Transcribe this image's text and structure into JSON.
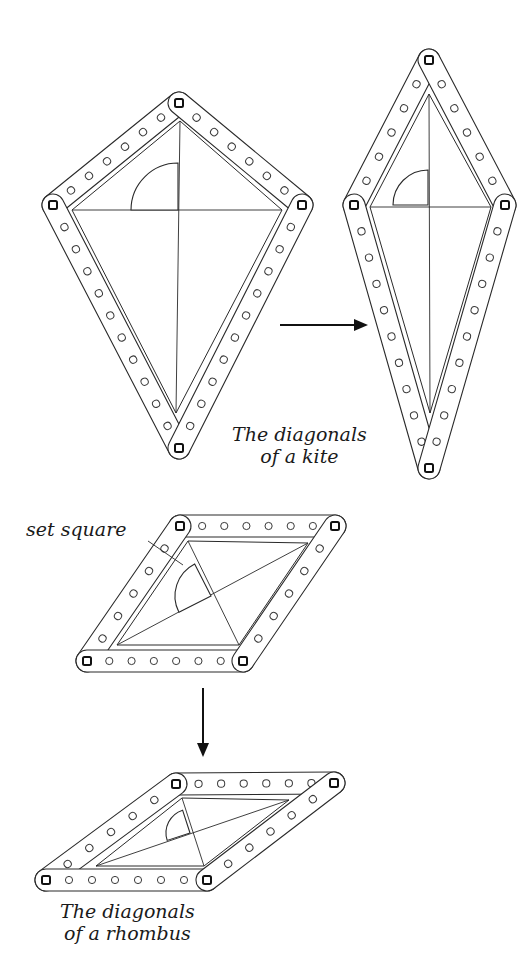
{
  "figure": {
    "captions": {
      "kite": [
        "The diagonals",
        "of a kite"
      ],
      "rhombus": [
        "The diagonals",
        "of a rhombus"
      ],
      "set_square_label": "set square"
    },
    "colors": {
      "ink": "#2a2a2a",
      "paper": "#ffffff"
    },
    "bar_width": 22,
    "diagrams": [
      {
        "id": "kite-1",
        "bars": [
          {
            "a": [
              179,
              103
            ],
            "b": [
              53,
              205
            ],
            "holes": 6
          },
          {
            "a": [
              179,
              103
            ],
            "b": [
              302,
              205
            ],
            "holes": 6
          },
          {
            "a": [
              53,
              205
            ],
            "b": [
              179,
              448
            ],
            "holes": 10
          },
          {
            "a": [
              302,
              205
            ],
            "b": [
              179,
              448
            ],
            "holes": 10
          }
        ],
        "inner": [
          [
            180,
            121
          ],
          [
            72,
            210
          ],
          [
            176,
            413
          ],
          [
            282,
            210
          ]
        ],
        "diagonals": [
          [
            [
              180,
              121
            ],
            [
              176,
              413
            ]
          ],
          [
            [
              72,
              210
            ],
            [
              282,
              210
            ]
          ]
        ],
        "set_square": {
          "corner": [
            178,
            210
          ],
          "r": 47,
          "rot": 0
        }
      },
      {
        "id": "kite-2",
        "bars": [
          {
            "a": [
              429,
              60
            ],
            "b": [
              354,
              205
            ],
            "holes": 5
          },
          {
            "a": [
              429,
              60
            ],
            "b": [
              505,
              205
            ],
            "holes": 5
          },
          {
            "a": [
              354,
              205
            ],
            "b": [
              429,
              468
            ],
            "holes": 9
          },
          {
            "a": [
              505,
              205
            ],
            "b": [
              429,
              468
            ],
            "holes": 9
          }
        ],
        "inner": [
          [
            429,
            94
          ],
          [
            370,
            207
          ],
          [
            430,
            413
          ],
          [
            491,
            207
          ]
        ],
        "diagonals": [
          [
            [
              429,
              94
            ],
            [
              430,
              413
            ]
          ],
          [
            [
              370,
              207
            ],
            [
              491,
              207
            ]
          ]
        ],
        "set_square": {
          "corner": [
            428,
            205
          ],
          "r": 35,
          "rot": 0
        }
      },
      {
        "id": "rhombus-1",
        "bars": [
          {
            "a": [
              180,
              526
            ],
            "b": [
              335,
              526
            ],
            "holes": 6
          },
          {
            "a": [
              180,
              526
            ],
            "b": [
              87,
              661
            ],
            "holes": 5
          },
          {
            "a": [
              87,
              661
            ],
            "b": [
              243,
              661
            ],
            "holes": 6
          },
          {
            "a": [
              335,
              526
            ],
            "b": [
              243,
              661
            ],
            "holes": 5
          }
        ],
        "inner": [
          [
            188,
            541
          ],
          [
            308,
            543
          ],
          [
            239,
            645
          ],
          [
            117,
            645
          ]
        ],
        "diagonals": [
          [
            [
              188,
              541
            ],
            [
              239,
              645
            ]
          ],
          [
            [
              117,
              645
            ],
            [
              308,
              543
            ]
          ]
        ],
        "set_square": {
          "corner": [
            211,
            596
          ],
          "r": 36,
          "rot": -27
        }
      },
      {
        "id": "rhombus-2",
        "bars": [
          {
            "a": [
              176,
              784
            ],
            "b": [
              334,
              783
            ],
            "holes": 6
          },
          {
            "a": [
              176,
              784
            ],
            "b": [
              46,
              880
            ],
            "holes": 5
          },
          {
            "a": [
              46,
              880
            ],
            "b": [
              207,
              880
            ],
            "holes": 6
          },
          {
            "a": [
              334,
              783
            ],
            "b": [
              207,
              880
            ],
            "holes": 5
          }
        ],
        "inner": [
          [
            182,
            798
          ],
          [
            289,
            800
          ],
          [
            204,
            866
          ],
          [
            96,
            866
          ]
        ],
        "diagonals": [
          [
            [
              182,
              798
            ],
            [
              204,
              866
            ]
          ],
          [
            [
              96,
              866
            ],
            [
              289,
              800
            ]
          ]
        ],
        "set_square": {
          "corner": [
            190,
            833
          ],
          "r": 24,
          "rot": -18
        }
      }
    ],
    "arrows": [
      {
        "from": [
          280,
          325
        ],
        "to": [
          368,
          325
        ]
      },
      {
        "from": [
          203,
          688
        ],
        "to": [
          203,
          757
        ]
      }
    ],
    "set_square_pointer": {
      "from": [
        148,
        541
      ],
      "to": [
        183,
        565
      ]
    }
  }
}
